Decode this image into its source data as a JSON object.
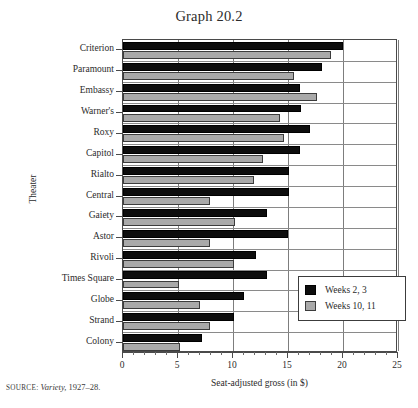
{
  "title": "Graph 20.2",
  "source": {
    "prefix": "SOURCE:",
    "publication": "Variety,",
    "years": "1927–28."
  },
  "legend": {
    "position": "inside-bottom-right",
    "items": [
      {
        "label": "Weeks 2, 3",
        "color": "#0d0d0d",
        "icon": "square-swatch-dark"
      },
      {
        "label": "Weeks 10, 11",
        "color": "#a9a9a9",
        "icon": "square-swatch-light"
      }
    ]
  },
  "axes": {
    "x": {
      "label": "Seat-adjusted gross (in $)",
      "ticks": [
        "0",
        "5",
        "10",
        "15",
        "20",
        "25"
      ],
      "min": 0,
      "max": 25,
      "minor_step": 1
    },
    "y": {
      "label": "Theater"
    }
  },
  "chart_data": {
    "type": "bar",
    "orientation": "horizontal",
    "title": "Graph 20.2",
    "xlabel": "Seat-adjusted gross (in $)",
    "ylabel": "Theater",
    "xlim": [
      0,
      25
    ],
    "grid": true,
    "categories": [
      "Criterion",
      "Paramount",
      "Embassy",
      "Warner's",
      "Roxy",
      "Capitol",
      "Rialto",
      "Central",
      "Gaiety",
      "Astor",
      "Rivoli",
      "Times Square",
      "Globe",
      "Strand",
      "Colony"
    ],
    "series": [
      {
        "name": "Weeks 2, 3",
        "color": "#0d0d0d",
        "values": [
          20.0,
          18.1,
          16.1,
          16.2,
          17.0,
          16.1,
          15.1,
          15.1,
          13.1,
          15.0,
          12.1,
          13.1,
          11.0,
          10.1,
          7.2
        ]
      },
      {
        "name": "Weeks 10, 11",
        "color": "#a9a9a9",
        "values": [
          18.9,
          15.5,
          17.6,
          14.3,
          14.6,
          12.7,
          11.9,
          7.9,
          10.2,
          7.9,
          10.1,
          5.1,
          7.0,
          7.9,
          5.2
        ]
      }
    ]
  }
}
